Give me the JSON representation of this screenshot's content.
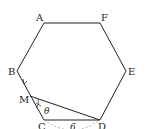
{
  "diagram": {
    "type": "regular-hexagon",
    "vertices": {
      "A": {
        "label": "A",
        "x": 44,
        "y": 23
      },
      "F": {
        "label": "F",
        "x": 100,
        "y": 23
      },
      "E": {
        "label": "E",
        "x": 126,
        "y": 71
      },
      "D": {
        "label": "D",
        "x": 100,
        "y": 120
      },
      "C": {
        "label": "C",
        "x": 44,
        "y": 120
      },
      "B": {
        "label": "B",
        "x": 17,
        "y": 71
      }
    },
    "point_M": {
      "label": "M",
      "on_side": "BC"
    },
    "segment": "MD",
    "angle_label": "θ",
    "arc_label": "6",
    "colors": {
      "line": "#222222",
      "dashed": "#999999",
      "background": "#ffffff"
    }
  }
}
